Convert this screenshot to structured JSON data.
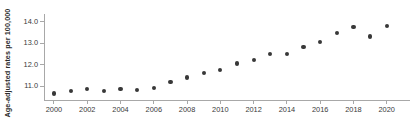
{
  "chart_data": {
    "type": "scatter",
    "title": "",
    "xlabel": "",
    "ylabel": "Age-adjusted rates per 100,000",
    "x": [
      2000,
      2001,
      2002,
      2003,
      2004,
      2005,
      2006,
      2007,
      2008,
      2009,
      2010,
      2011,
      2012,
      2013,
      2014,
      2015,
      2016,
      2017,
      2018,
      2019,
      2020
    ],
    "values": [
      10.65,
      10.75,
      10.85,
      10.78,
      10.85,
      10.82,
      10.9,
      11.2,
      11.4,
      11.6,
      11.75,
      12.05,
      12.2,
      12.5,
      12.5,
      12.8,
      13.05,
      13.45,
      13.75,
      13.3,
      13.8
    ],
    "series": [
      {
        "name": "Age-adjusted rate",
        "values": [
          10.65,
          10.75,
          10.85,
          10.78,
          10.85,
          10.82,
          10.9,
          11.2,
          11.4,
          11.6,
          11.75,
          12.05,
          12.2,
          12.5,
          12.5,
          12.8,
          13.05,
          13.45,
          13.75,
          13.3,
          13.8
        ]
      }
    ],
    "xlim": [
      1999.4,
      2021.4
    ],
    "ylim": [
      10.35,
      14.35
    ],
    "y_ticks": [
      "11.0",
      "12.0",
      "13.0",
      "14.0"
    ],
    "y_tick_values": [
      11.0,
      12.0,
      13.0,
      14.0
    ],
    "x_ticks": [
      "2000",
      "2002",
      "2004",
      "2006",
      "2008",
      "2010",
      "2012",
      "2014",
      "2016",
      "2018",
      "2020"
    ],
    "x_tick_values": [
      2000,
      2002,
      2004,
      2006,
      2008,
      2010,
      2012,
      2014,
      2016,
      2018,
      2020
    ],
    "grid": false,
    "legend": false,
    "marker_color": "#383838",
    "axis_color": "#a8a8a8"
  }
}
